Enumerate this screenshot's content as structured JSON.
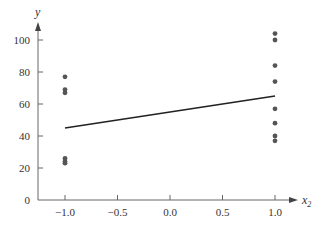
{
  "chart_data": {
    "type": "scatter",
    "title": "",
    "xlabel": "x",
    "xlabel_subscript": "2",
    "ylabel": "y",
    "xlim": [
      -1.25,
      1.2
    ],
    "ylim": [
      0,
      110
    ],
    "grid": false,
    "legend": null,
    "x_ticks": [
      -1.0,
      -0.5,
      0.0,
      0.5,
      1.0
    ],
    "x_tick_labels": [
      "−1.0",
      "−0.5",
      "0.0",
      "0.5",
      "1.0"
    ],
    "y_ticks": [
      0,
      20,
      40,
      60,
      80,
      100
    ],
    "y_tick_labels": [
      "0",
      "20",
      "40",
      "60",
      "80",
      "100"
    ],
    "series": [
      {
        "name": "observations",
        "kind": "scatter",
        "color": "#555555",
        "points": [
          {
            "x": -1.0,
            "y": 77
          },
          {
            "x": -1.0,
            "y": 69
          },
          {
            "x": -1.0,
            "y": 67
          },
          {
            "x": -1.0,
            "y": 26
          },
          {
            "x": -1.0,
            "y": 24
          },
          {
            "x": -1.0,
            "y": 23
          },
          {
            "x": 1.0,
            "y": 104
          },
          {
            "x": 1.0,
            "y": 100
          },
          {
            "x": 1.0,
            "y": 84
          },
          {
            "x": 1.0,
            "y": 74
          },
          {
            "x": 1.0,
            "y": 57
          },
          {
            "x": 1.0,
            "y": 48
          },
          {
            "x": 1.0,
            "y": 40
          },
          {
            "x": 1.0,
            "y": 37
          }
        ]
      },
      {
        "name": "fitted line",
        "kind": "line",
        "color": "#222222",
        "points": [
          {
            "x": -1.0,
            "y": 45
          },
          {
            "x": 1.0,
            "y": 65
          }
        ]
      }
    ]
  }
}
